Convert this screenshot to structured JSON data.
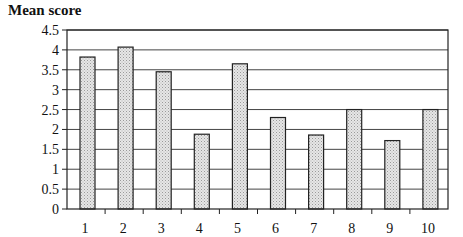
{
  "chart_data": {
    "type": "bar",
    "title": "",
    "ylabel": "Mean score",
    "xlabel": "",
    "categories": [
      "1",
      "2",
      "3",
      "4",
      "5",
      "6",
      "7",
      "8",
      "9",
      "10"
    ],
    "values": [
      3.82,
      4.07,
      3.45,
      1.88,
      3.65,
      2.3,
      1.86,
      2.5,
      1.72,
      2.5
    ],
    "ylim": [
      0,
      4.5
    ],
    "yticks": [
      "0",
      "0.5",
      "1",
      "1.5",
      "2",
      "2.5",
      "3",
      "3.5",
      "4",
      "4.5"
    ],
    "grid": true,
    "legend": null,
    "colors": {
      "bar_fill": "#d9d9d9",
      "bar_stroke": "#222222",
      "grid": "#444444"
    }
  }
}
